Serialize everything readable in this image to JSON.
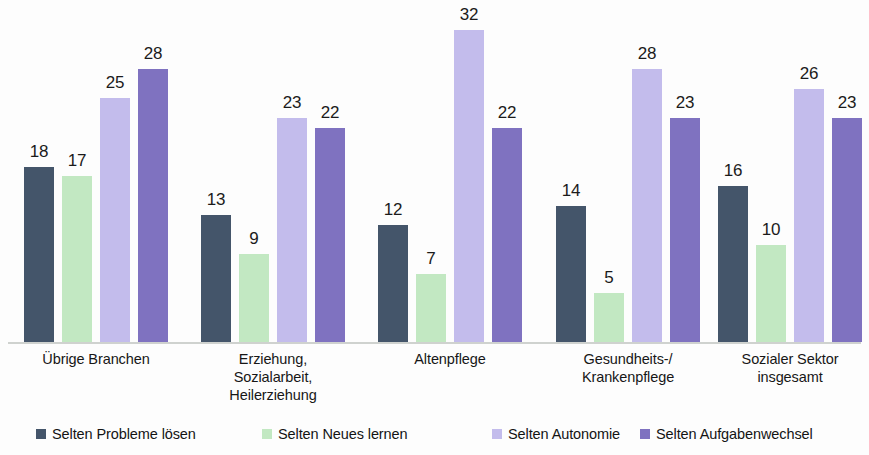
{
  "chart_data": {
    "type": "bar",
    "title": "",
    "subtitle": "",
    "xlabel": "",
    "ylabel": "",
    "ylim": [
      0,
      34
    ],
    "grid": false,
    "legend_position": "bottom",
    "value_labels": true,
    "categories": [
      "Übrige Branchen",
      "Erziehung,\nSozialarbeit,\nHeilerziehung",
      "Altenpflege",
      "Gesundheits-/\nKrankenpflege",
      "Sozialer Sektor\ninsgesamt"
    ],
    "series": [
      {
        "name": "Selten Probleme lösen",
        "color": "#44556a",
        "values": [
          18,
          13,
          12,
          14,
          16
        ]
      },
      {
        "name": "Selten Neues lernen",
        "color": "#c2e8c2",
        "values": [
          17,
          9,
          7,
          5,
          10
        ]
      },
      {
        "name": "Selten Autonomie",
        "color": "#c3bcec",
        "values": [
          25,
          23,
          32,
          28,
          26
        ]
      },
      {
        "name": "Selten Aufgabenwechsel",
        "color": "#7f72c0",
        "values": [
          28,
          22,
          22,
          23,
          23
        ]
      }
    ]
  },
  "categories_display": [
    {
      "lines": [
        "Übrige Branchen"
      ]
    },
    {
      "lines": [
        "Erziehung,",
        "Sozialarbeit,",
        "Heilerziehung"
      ]
    },
    {
      "lines": [
        "Altenpflege"
      ]
    },
    {
      "lines": [
        "Gesundheits-/",
        "Krankenpflege"
      ]
    },
    {
      "lines": [
        "Sozialer Sektor",
        "insgesamt"
      ]
    }
  ],
  "legend": {
    "items": [
      {
        "label": "Selten Probleme lösen",
        "color": "#44556a"
      },
      {
        "label": "Selten Neues lernen",
        "color": "#c2e8c2"
      },
      {
        "label": "Selten Autonomie",
        "color": "#c3bcec"
      },
      {
        "label": "Selten Aufgabenwechsel",
        "color": "#7f72c0"
      }
    ]
  },
  "layout": {
    "group_centers": [
      96,
      273,
      450,
      628,
      790
    ],
    "group_width": 180,
    "legend_lefts": [
      36,
      262,
      492,
      640
    ],
    "baseline_color": "#cfd2cf",
    "pixels_per_unit": 9.75,
    "bar_width": 30,
    "bar_gap": 8
  }
}
